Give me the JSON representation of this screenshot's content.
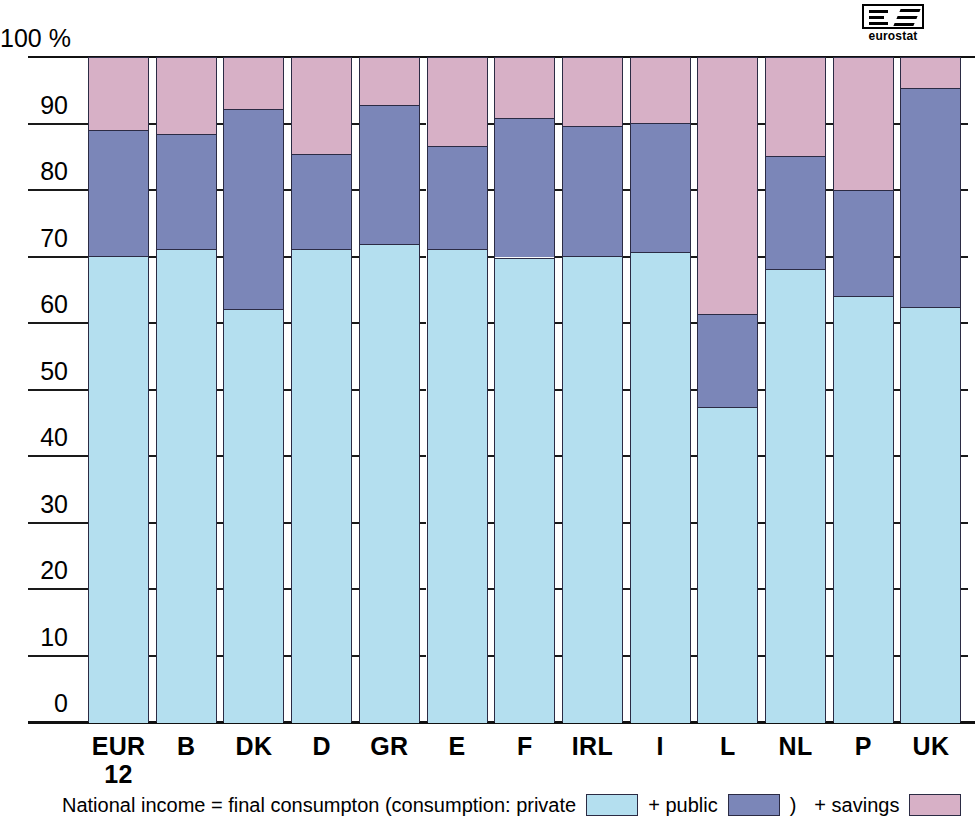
{
  "logo": {
    "word": "eurostat",
    "alt": "eurostat-logo"
  },
  "axis": {
    "unit_label": "100 %",
    "ticks": [
      "100 %",
      "90",
      "80",
      "70",
      "60",
      "50",
      "40",
      "30",
      "20",
      "10",
      "0"
    ],
    "tick_values": [
      100,
      90,
      80,
      70,
      60,
      50,
      40,
      30,
      20,
      10,
      0
    ]
  },
  "legend": {
    "text_1": "National income = final consumpton (consumption: private",
    "text_2": "+ public",
    "text_3": ")",
    "text_4": "+ savings",
    "swatch_private": "private-swatch",
    "swatch_public": "public-swatch",
    "swatch_savings": "savings-swatch"
  },
  "colors": {
    "private": "#b4dfef",
    "public": "#7b86b8",
    "savings": "#d7b0c6",
    "outline": "#2b2b44",
    "background": "#ffffff"
  },
  "chart_data": {
    "type": "bar",
    "stacked": true,
    "title": "",
    "subtitle": "",
    "xlabel": "",
    "ylabel": "100 %",
    "ylim": [
      0,
      100
    ],
    "yticks": [
      0,
      10,
      20,
      30,
      40,
      50,
      60,
      70,
      80,
      90,
      100
    ],
    "grid": false,
    "legend_position": "bottom",
    "categories": [
      "EUR 12",
      "B",
      "DK",
      "D",
      "GR",
      "E",
      "F",
      "IRL",
      "I",
      "L",
      "NL",
      "P",
      "UK"
    ],
    "category_labels": [
      {
        "line1": "EUR",
        "line2": "12"
      },
      {
        "line1": "B",
        "line2": ""
      },
      {
        "line1": "DK",
        "line2": ""
      },
      {
        "line1": "D",
        "line2": ""
      },
      {
        "line1": "GR",
        "line2": ""
      },
      {
        "line1": "E",
        "line2": ""
      },
      {
        "line1": "F",
        "line2": ""
      },
      {
        "line1": "IRL",
        "line2": ""
      },
      {
        "line1": "I",
        "line2": ""
      },
      {
        "line1": "L",
        "line2": ""
      },
      {
        "line1": "NL",
        "line2": ""
      },
      {
        "line1": "P",
        "line2": ""
      },
      {
        "line1": "UK",
        "line2": ""
      }
    ],
    "series": [
      {
        "name": "private consumption",
        "color": "#b4dfef",
        "values": [
          70.2,
          71.3,
          62.2,
          71.3,
          72.0,
          71.3,
          70.0,
          70.2,
          70.8,
          47.5,
          68.3,
          64.2,
          62.5
        ]
      },
      {
        "name": "+ public",
        "color": "#7b86b8",
        "cumulative_top": [
          89.2,
          88.5,
          92.3,
          85.5,
          93.0,
          86.7,
          91.0,
          89.7,
          90.2,
          61.5,
          85.3,
          80.2,
          95.5
        ],
        "values": [
          19.0,
          17.2,
          30.1,
          14.2,
          21.0,
          15.4,
          21.0,
          19.5,
          19.4,
          14.0,
          17.0,
          16.0,
          33.0
        ]
      },
      {
        "name": "+ savings",
        "color": "#d7b0c6",
        "cumulative_top": [
          100,
          100,
          100,
          100,
          100,
          100,
          100,
          100,
          100,
          100,
          100,
          100,
          100
        ],
        "values": [
          10.8,
          11.5,
          7.7,
          14.5,
          7.0,
          13.3,
          9.0,
          10.3,
          9.8,
          38.5,
          14.7,
          19.8,
          4.5
        ]
      }
    ]
  }
}
